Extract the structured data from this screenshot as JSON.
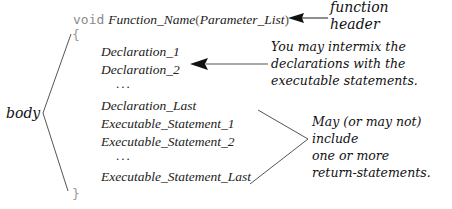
{
  "header": {
    "return_type": "void",
    "function_name": "Function_Name",
    "open_paren": "(",
    "parameter_list": "Parameter_List",
    "close_paren": ")"
  },
  "braces": {
    "open": "{",
    "close": "}"
  },
  "body_lines": [
    "Declaration_1",
    "Declaration_2",
    "...",
    "Declaration_Last",
    "Executable_Statement_1",
    "Executable_Statement_2",
    "...",
    "Executable_Statement_Last"
  ],
  "annotations": {
    "function_header": [
      "function",
      "header"
    ],
    "body_label": "body",
    "declarations_note": [
      "You may intermix the",
      "declarations with the",
      "executable statements."
    ],
    "return_note": [
      "May (or may not)",
      "include",
      "one or more",
      "return-statements."
    ]
  },
  "colors": {
    "keyword": "#8a8a8a",
    "code": "#222222",
    "lines": "#555555",
    "arrow": "#111111"
  }
}
